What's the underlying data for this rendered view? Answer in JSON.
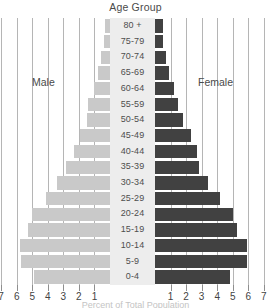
{
  "chart": {
    "title": "Age Group",
    "xaxis_title": "Percent of Total Population",
    "legend_male": "Male",
    "legend_female": "Female",
    "male_color": "#c9c9c9",
    "female_color": "#414141",
    "gridline_color": "#b5b5b5",
    "center_strip_color": "#ededed"
  },
  "axis": {
    "tick_labels_left": [
      "7",
      "6",
      "5",
      "4",
      "3",
      "2",
      "1"
    ],
    "tick_labels_right": [
      "1",
      "2",
      "3",
      "4",
      "5",
      "6",
      "7"
    ]
  },
  "chart_data": {
    "type": "bar",
    "subtype": "population-pyramid",
    "title": "Age Group",
    "xlabel": "Percent of Total Population",
    "ylabel": "Age Group",
    "xlim": [
      -7,
      7
    ],
    "xtick_values": [
      -7,
      -6,
      -5,
      -4,
      -3,
      -2,
      -1,
      1,
      2,
      3,
      4,
      5,
      6,
      7
    ],
    "xtick_labels": [
      "7",
      "6",
      "5",
      "4",
      "3",
      "2",
      "1",
      "1",
      "2",
      "3",
      "4",
      "5",
      "6",
      "7"
    ],
    "grid": true,
    "legend_position": "inside",
    "categories": [
      "80 +",
      "75-79",
      "70-74",
      "65-69",
      "60-64",
      "55-59",
      "50-54",
      "45-49",
      "40-44",
      "35-39",
      "30-34",
      "25-29",
      "20-24",
      "15-19",
      "10-14",
      "5-9",
      "0-4"
    ],
    "series": [
      {
        "name": "Male",
        "color": "#c9c9c9",
        "side": "left",
        "values": [
          0.3,
          0.4,
          0.6,
          0.8,
          1.0,
          1.4,
          1.5,
          1.9,
          2.3,
          2.8,
          3.4,
          4.1,
          5.0,
          5.3,
          5.8,
          5.7,
          4.9
        ]
      },
      {
        "name": "Female",
        "color": "#414141",
        "side": "right",
        "values": [
          0.5,
          0.5,
          0.7,
          0.9,
          1.2,
          1.5,
          1.8,
          2.3,
          2.7,
          2.8,
          3.4,
          4.2,
          5.0,
          5.3,
          5.9,
          5.9,
          4.8
        ]
      }
    ]
  }
}
